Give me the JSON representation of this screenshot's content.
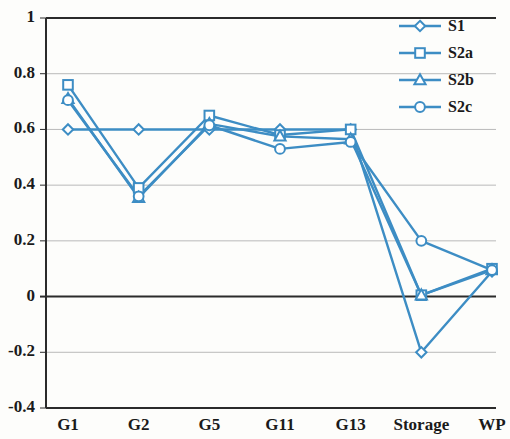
{
  "chart_data": {
    "type": "line",
    "title": "",
    "xlabel": "",
    "ylabel": "",
    "categories": [
      "G1",
      "G2",
      "G5",
      "G11",
      "G13",
      "Storage",
      "WP"
    ],
    "ylim": [
      -0.4,
      1
    ],
    "yticks": [
      -0.4,
      -0.2,
      0,
      0.2,
      0.4,
      0.6,
      0.8,
      1
    ],
    "ytick_labels": [
      "-0.4",
      "-0.2",
      "0",
      "0.2",
      "0.4",
      "0.6",
      "0.8",
      "1"
    ],
    "grid": true,
    "legend_position": "top-right",
    "series": [
      {
        "name": "S1",
        "marker": "diamond",
        "color": "#3d8dc4",
        "values": [
          0.6,
          0.6,
          0.6,
          0.6,
          0.6,
          -0.2,
          0.09
        ]
      },
      {
        "name": "S2a",
        "marker": "square",
        "color": "#3d8dc4",
        "values": [
          0.76,
          0.39,
          0.65,
          0.58,
          0.6,
          0.005,
          0.1
        ]
      },
      {
        "name": "S2b",
        "marker": "triangle",
        "color": "#3d8dc4",
        "values": [
          0.71,
          0.355,
          0.62,
          0.575,
          0.565,
          0.005,
          0.095
        ]
      },
      {
        "name": "S2c",
        "marker": "circle",
        "color": "#3d8dc4",
        "values": [
          0.705,
          0.36,
          0.615,
          0.53,
          0.555,
          0.2,
          0.095
        ]
      }
    ]
  },
  "legend": {
    "entries": [
      {
        "label": "S1",
        "marker": "diamond-marker"
      },
      {
        "label": "S2a",
        "marker": "square-marker"
      },
      {
        "label": "S2b",
        "marker": "triangle-marker"
      },
      {
        "label": "S2c",
        "marker": "circle-marker"
      }
    ]
  },
  "colors": {
    "series": "#3d8dc4",
    "axis": "#2b2b2b",
    "grid": "#b9b9b9",
    "zero_line": "#2b2b2b",
    "background": "#fdfdfb"
  }
}
